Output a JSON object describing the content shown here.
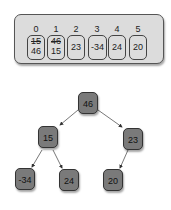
{
  "array": {
    "indices": [
      "0",
      "1",
      "2",
      "3",
      "4",
      "5"
    ],
    "cells": [
      {
        "old": "15",
        "value": "46"
      },
      {
        "old": "46",
        "value": "15"
      },
      {
        "old": null,
        "value": "23"
      },
      {
        "old": null,
        "value": "-34"
      },
      {
        "old": null,
        "value": "24"
      },
      {
        "old": null,
        "value": "20"
      }
    ]
  },
  "tree": {
    "root": "46",
    "l": "15",
    "r": "23",
    "ll": "-34",
    "lr": "24",
    "rl": "20"
  },
  "colors": {
    "node": "#7a7a7a",
    "array_bg": "#dcdcdc"
  }
}
